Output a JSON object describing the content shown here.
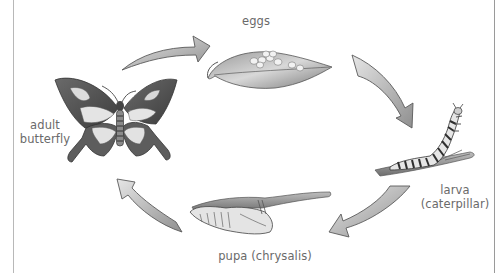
{
  "diagram": {
    "type": "life-cycle",
    "subject": "butterfly",
    "stages": [
      {
        "id": "eggs",
        "label": "eggs"
      },
      {
        "id": "larva",
        "label_line1": "larva",
        "label_line2": "(caterpillar)"
      },
      {
        "id": "pupa",
        "label": "pupa (chrysalis)"
      },
      {
        "id": "adult",
        "label_line1": "adult",
        "label_line2": "butterfly"
      }
    ],
    "arrows": [
      {
        "from": "adult",
        "to": "eggs"
      },
      {
        "from": "eggs",
        "to": "larva"
      },
      {
        "from": "larva",
        "to": "pupa"
      },
      {
        "from": "pupa",
        "to": "adult"
      }
    ],
    "colors": {
      "arrow_fill": "#b5b5b5",
      "arrow_stroke": "#5a5a5a",
      "label_text": "#6a6a6a",
      "border": "#b8b8b8"
    }
  }
}
